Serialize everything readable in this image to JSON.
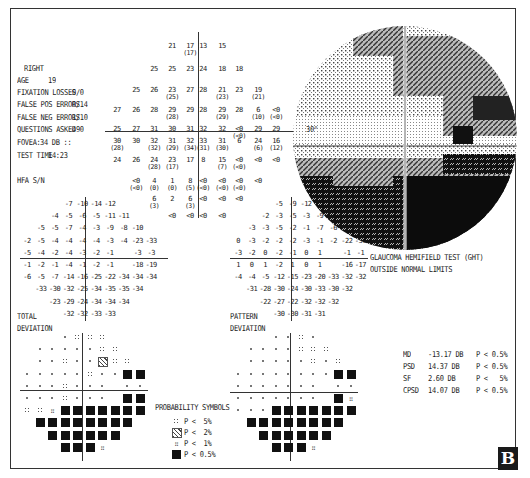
{
  "header": {
    "eye": "RIGHT",
    "age_label": "AGE",
    "age": "19",
    "fixation_losses_label": "FIXATION LOSSES",
    "fixation_losses": "0/0",
    "false_pos_label": "FALSE POS ERRORS",
    "false_pos": "0/14",
    "false_neg_label": "FALSE NEG ERRORS",
    "false_neg": "1/10",
    "questions_label": "QUESTIONS ASKED",
    "questions": "490",
    "fovea_label": "FOVEA:",
    "fovea": "34 DB ::",
    "test_time_label": "TEST TIME",
    "test_time": "14:23",
    "hfa": "HFA S/N"
  },
  "threshold_values": {
    "rows": [
      [
        {
          "x": 172,
          "v": "21"
        },
        {
          "x": 190,
          "v": "17",
          "s": "(17)"
        },
        {
          "x": 203,
          "v": "13"
        },
        {
          "x": 222,
          "v": "15"
        }
      ],
      [
        {
          "x": 154,
          "v": "25"
        },
        {
          "x": 172,
          "v": "25"
        },
        {
          "x": 190,
          "v": "23"
        },
        {
          "x": 203,
          "v": "24"
        },
        {
          "x": 222,
          "v": "18"
        },
        {
          "x": 239,
          "v": "18"
        }
      ],
      [
        {
          "x": 136,
          "v": "25"
        },
        {
          "x": 154,
          "v": "26"
        },
        {
          "x": 172,
          "v": "23",
          "s": "(25)"
        },
        {
          "x": 190,
          "v": "27"
        },
        {
          "x": 203,
          "v": "28"
        },
        {
          "x": 222,
          "v": "21",
          "s": "(23)"
        },
        {
          "x": 239,
          "v": "23"
        },
        {
          "x": 258,
          "v": "19",
          "s": "(21)"
        }
      ],
      [
        {
          "x": 117,
          "v": "27"
        },
        {
          "x": 136,
          "v": "26"
        },
        {
          "x": 154,
          "v": "28"
        },
        {
          "x": 172,
          "v": "29",
          "s": "(28)"
        },
        {
          "x": 190,
          "v": "29"
        },
        {
          "x": 203,
          "v": "28"
        },
        {
          "x": 222,
          "v": "29",
          "s": "(29)"
        },
        {
          "x": 239,
          "v": "28"
        },
        {
          "x": 258,
          "v": "6",
          "s": "(10)"
        },
        {
          "x": 276,
          "v": "<0",
          "s": "(<0)"
        }
      ],
      [
        {
          "x": 117,
          "v": "25"
        },
        {
          "x": 136,
          "v": "27"
        },
        {
          "x": 154,
          "v": "31"
        },
        {
          "x": 172,
          "v": "30"
        },
        {
          "x": 190,
          "v": "31"
        },
        {
          "x": 203,
          "v": "32"
        },
        {
          "x": 222,
          "v": "32"
        },
        {
          "x": 239,
          "v": "<0",
          "s": "(<0)"
        },
        {
          "x": 258,
          "v": "29"
        },
        {
          "x": 276,
          "v": "29"
        }
      ],
      [
        {
          "x": 117,
          "v": "30",
          "s": "(28)"
        },
        {
          "x": 136,
          "v": "30"
        },
        {
          "x": 154,
          "v": "32",
          "s": "(32)"
        },
        {
          "x": 172,
          "v": "31",
          "s": "(29)"
        },
        {
          "x": 190,
          "v": "32",
          "s": "(34)"
        },
        {
          "x": 203,
          "v": "33",
          "s": "(31)"
        },
        {
          "x": 222,
          "v": "31",
          "s": "(30)"
        },
        {
          "x": 239,
          "v": "6"
        },
        {
          "x": 258,
          "v": "24",
          "s": "(6)"
        },
        {
          "x": 276,
          "v": "16",
          "s": "(12)"
        }
      ],
      [
        {
          "x": 117,
          "v": "24"
        },
        {
          "x": 136,
          "v": "26"
        },
        {
          "x": 154,
          "v": "24",
          "s": "(28)"
        },
        {
          "x": 172,
          "v": "23",
          "s": "(17)"
        },
        {
          "x": 190,
          "v": "17"
        },
        {
          "x": 203,
          "v": "8"
        },
        {
          "x": 222,
          "v": "15",
          "s": "(7)"
        },
        {
          "x": 239,
          "v": "<0",
          "s": "(<0)"
        },
        {
          "x": 258,
          "v": "<0"
        },
        {
          "x": 276,
          "v": "<0"
        }
      ],
      [
        {
          "x": 136,
          "v": "<0",
          "s": "(<0)"
        },
        {
          "x": 154,
          "v": "4",
          "s": "(0)"
        },
        {
          "x": 172,
          "v": "1",
          "s": "(0)"
        },
        {
          "x": 190,
          "v": "8",
          "s": "(5)"
        },
        {
          "x": 203,
          "v": "<0",
          "s": "(<0)"
        },
        {
          "x": 222,
          "v": "<0",
          "s": "(<0)"
        },
        {
          "x": 239,
          "v": "<0",
          "s": "(<0)"
        },
        {
          "x": 258,
          "v": "<0"
        }
      ],
      [
        {
          "x": 154,
          "v": "6",
          "s": "(3)"
        },
        {
          "x": 172,
          "v": "2"
        },
        {
          "x": 190,
          "v": "6",
          "s": "(3)"
        },
        {
          "x": 203,
          "v": "<0"
        },
        {
          "x": 222,
          "v": "<0"
        },
        {
          "x": 239,
          "v": "<0"
        }
      ],
      [
        {
          "x": 172,
          "v": "<0"
        },
        {
          "x": 190,
          "v": "<0"
        },
        {
          "x": 203,
          "v": "<0"
        },
        {
          "x": 222,
          "v": "<0"
        }
      ]
    ]
  },
  "total_deviation": {
    "label1": "TOTAL",
    "label2": "DEVIATION",
    "rows": [
      [
        "",
        "",
        "",
        "-7",
        "-10",
        "-14",
        "-12",
        "",
        "",
        ""
      ],
      [
        "",
        "",
        "-4",
        "-5",
        "-6",
        "-5",
        "-11",
        "-11",
        "",
        ""
      ],
      [
        "",
        "-5",
        "-5",
        "-7",
        "-4",
        "-3",
        "-9",
        "-8",
        "-10",
        ""
      ],
      [
        "-2",
        "-5",
        "-4",
        "-4",
        "-4",
        "-4",
        "-3",
        "-4",
        "-23",
        "-33"
      ],
      [
        "-5",
        "-4",
        "-2",
        "-4",
        "-3",
        "-2",
        "-1",
        "",
        "-3",
        "-3"
      ],
      [
        "-1",
        "-2",
        "-1",
        "-4",
        "-1",
        "-2",
        "-1",
        "",
        "-18",
        "-19"
      ],
      [
        "-6",
        "-5",
        "-7",
        "-14",
        "-16",
        "-25",
        "-22",
        "-34",
        "-34",
        "-34"
      ],
      [
        "",
        "-33",
        "-30",
        "-32",
        "-25",
        "-34",
        "-35",
        "-35",
        "-34",
        ""
      ],
      [
        "",
        "",
        "-23",
        "-29",
        "-24",
        "-34",
        "-34",
        "-34",
        "",
        ""
      ],
      [
        "",
        "",
        "",
        "-32",
        "-32",
        "-33",
        "-33",
        "",
        "",
        ""
      ]
    ]
  },
  "pattern_deviation": {
    "label1": "PATTERN",
    "label2": "DEVIATION",
    "rows": [
      [
        "",
        "",
        "",
        "-5",
        "-9",
        "-12",
        "-10",
        "",
        "",
        ""
      ],
      [
        "",
        "",
        "-2",
        "-3",
        "-5",
        "-3",
        "-9",
        "-9",
        "",
        ""
      ],
      [
        "",
        "-3",
        "-3",
        "-5",
        "-2",
        "-1",
        "-7",
        "-6",
        "-9",
        ""
      ],
      [
        "0",
        "-3",
        "-2",
        "-2",
        "-2",
        "-3",
        "-1",
        "-2",
        "-22",
        "-31"
      ],
      [
        "-3",
        "-2",
        "0",
        "-2",
        "-1",
        "0",
        "1",
        "",
        "-1",
        "-1"
      ],
      [
        "1",
        "0",
        "1",
        "-2",
        "1",
        "0",
        "1",
        "",
        "-16",
        "-17"
      ],
      [
        "-4",
        "-4",
        "-5",
        "-12",
        "-15",
        "-23",
        "-20",
        "-33",
        "-32",
        "-32"
      ],
      [
        "",
        "-31",
        "-28",
        "-30",
        "-24",
        "-30",
        "-33",
        "-30",
        "-32",
        ""
      ],
      [
        "",
        "",
        "-22",
        "-27",
        "-22",
        "-32",
        "-32",
        "-32",
        "",
        ""
      ],
      [
        "",
        "",
        "",
        "-30",
        "-30",
        "-31",
        "-31",
        "",
        "",
        ""
      ]
    ]
  },
  "total_prob": {
    "rows": [
      [
        "",
        "",
        "",
        "n",
        "5",
        "5",
        "5",
        "",
        "",
        ""
      ],
      [
        "",
        "n",
        "n",
        "n",
        "n",
        "n",
        "5",
        "5",
        "",
        ""
      ],
      [
        "",
        "n",
        "n",
        "5",
        "n",
        "n",
        "2",
        "5",
        "5",
        ""
      ],
      [
        "n",
        "n",
        "n",
        "n",
        "n",
        "5",
        "n",
        "n",
        "b",
        "b"
      ],
      [
        "n",
        "n",
        "n",
        "5",
        "n",
        "n",
        "n",
        "",
        "n",
        "n"
      ],
      [
        "n",
        "n",
        "n",
        "5",
        "n",
        "n",
        "n",
        "",
        "b",
        "b"
      ],
      [
        "5",
        "5",
        "1",
        "b",
        "b",
        "b",
        "b",
        "b",
        "b",
        "b"
      ],
      [
        "",
        "b",
        "b",
        "b",
        "b",
        "b",
        "b",
        "b",
        "b",
        ""
      ],
      [
        "",
        "",
        "b",
        "b",
        "b",
        "b",
        "b",
        "b",
        "",
        ""
      ],
      [
        "",
        "",
        "",
        "b",
        "b",
        "b",
        "1",
        "",
        "",
        ""
      ]
    ]
  },
  "pattern_prob": {
    "rows": [
      [
        "",
        "",
        "",
        "n",
        "n",
        "5",
        "n",
        "",
        "",
        ""
      ],
      [
        "",
        "n",
        "n",
        "n",
        "n",
        "5",
        "5",
        "5",
        "",
        ""
      ],
      [
        "",
        "n",
        "n",
        "n",
        "n",
        "n",
        "5",
        "n",
        "5",
        ""
      ],
      [
        "n",
        "n",
        "n",
        "n",
        "n",
        "n",
        "n",
        "n",
        "b",
        "b"
      ],
      [
        "n",
        "n",
        "n",
        "n",
        "n",
        "n",
        "n",
        "",
        "n",
        "n"
      ],
      [
        "n",
        "n",
        "n",
        "n",
        "n",
        "n",
        "n",
        "",
        "b",
        "1"
      ],
      [
        "n",
        "n",
        "n",
        "b",
        "b",
        "b",
        "b",
        "b",
        "b",
        "b"
      ],
      [
        "",
        "b",
        "b",
        "b",
        "b",
        "b",
        "b",
        "b",
        "b",
        ""
      ],
      [
        "",
        "",
        "b",
        "b",
        "b",
        "b",
        "b",
        "b",
        "",
        ""
      ],
      [
        "",
        "",
        "",
        "b",
        "b",
        "b",
        "1",
        "",
        "",
        ""
      ]
    ]
  },
  "grayscale": {
    "degree_label": "30°"
  },
  "ght": {
    "line1": "GLAUCOMA HEMIFIELD TEST (GHT)",
    "line2": "OUTSIDE NORMAL LIMITS"
  },
  "global_indices": [
    {
      "label": "MD",
      "value": "-13.17 DB",
      "p": "P < 0.5%"
    },
    {
      "label": "PSD",
      "value": "14.37 DB",
      "p": "P < 0.5%"
    },
    {
      "label": "SF",
      "value": "2.60 DB",
      "p": "P <   5%"
    },
    {
      "label": "CPSD",
      "value": "14.07 DB",
      "p": "P < 0.5%"
    }
  ],
  "legend": {
    "title": "PROBABILITY SYMBOLS",
    "items": [
      {
        "sym": "5",
        "label": "P <  5%"
      },
      {
        "sym": "2",
        "label": "P <  2%"
      },
      {
        "sym": "1",
        "label": "P <  1%"
      },
      {
        "sym": "b",
        "label": "P < 0.5%"
      }
    ]
  },
  "panel_label": "B"
}
